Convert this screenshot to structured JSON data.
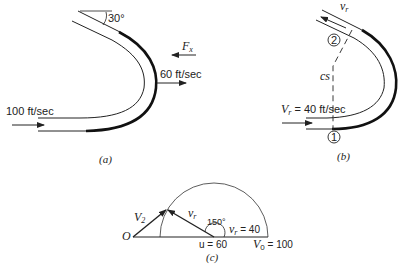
{
  "figure_a": {
    "caption": "(a)",
    "inlet_velocity_label": "100 ft/sec",
    "outlet_velocity_label": "60 ft/sec",
    "force_label": "F",
    "force_subscript": "x",
    "angle_label": "30°"
  },
  "figure_b": {
    "caption": "(b)",
    "relative_velocity_label": "v",
    "relative_velocity_subscript": "r",
    "inlet_label_main": "V",
    "inlet_label_sub": "r",
    "inlet_label_value": " = 40 ft/sec",
    "control_surface_label": "cs",
    "section_1": "1",
    "section_2": "2"
  },
  "figure_c": {
    "caption": "(c)",
    "origin_label": "O",
    "v2_label": "V",
    "v2_sub": "2",
    "vr_label": "v",
    "vr_sub": "r",
    "angle_label": "150°",
    "vr_value_label": "v",
    "vr_value_sub": "r",
    "vr_value": " = 40",
    "u_label": "u = 60",
    "v0_label": "V",
    "v0_sub": "0",
    "v0_value": " = 100"
  },
  "colors": {
    "ink": "#222222",
    "background": "#ffffff"
  }
}
